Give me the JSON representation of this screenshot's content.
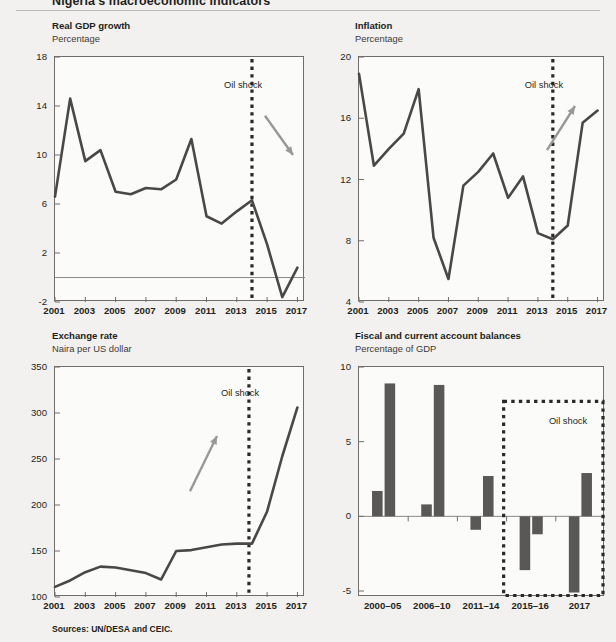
{
  "figure": {
    "title": "Nigeria's macroeconomic indicators",
    "sources": "Sources: UN/DESA and CEIC.",
    "oil_shock_label": "Oil shock",
    "line_color": "#4a4846",
    "bar_color": "#5a5856",
    "arrow_color": "#9a9896",
    "axis_color": "#6f6d6b"
  },
  "chart_data": [
    {
      "id": "real-gdp-growth",
      "type": "line",
      "title": "Real GDP growth",
      "subtitle": "Percentage",
      "xlabel": "",
      "ylabel": "Percentage",
      "ylim": [
        -2,
        18
      ],
      "yticks": [
        18,
        14,
        10,
        6,
        2,
        -2
      ],
      "xlim": [
        2001,
        2017.5
      ],
      "xticks": [
        2001,
        2003,
        2005,
        2007,
        2009,
        2011,
        2013,
        2015,
        2017
      ],
      "grid": false,
      "zero_line": 0,
      "x": [
        2001,
        2002,
        2003,
        2004,
        2005,
        2006,
        2007,
        2008,
        2009,
        2010,
        2011,
        2012,
        2013,
        2014,
        2015,
        2016,
        2017
      ],
      "values": [
        6.6,
        14.6,
        9.5,
        10.4,
        7.0,
        6.8,
        7.3,
        7.2,
        8.0,
        11.3,
        5.0,
        4.4,
        5.4,
        6.3,
        2.7,
        -1.6,
        0.8
      ],
      "annotations": [
        {
          "kind": "vline",
          "label": "Oil shock",
          "x": 2014
        },
        {
          "kind": "arrow",
          "direction": "down-right"
        }
      ]
    },
    {
      "id": "inflation",
      "type": "line",
      "title": "Inflation",
      "subtitle": "Percentage",
      "xlabel": "",
      "ylabel": "Percentage",
      "ylim": [
        4,
        20
      ],
      "yticks": [
        20,
        16,
        12,
        8,
        4
      ],
      "xlim": [
        2001,
        2017.5
      ],
      "xticks": [
        2001,
        2003,
        2005,
        2007,
        2009,
        2011,
        2013,
        2015,
        2017
      ],
      "grid": false,
      "x": [
        2001,
        2002,
        2003,
        2004,
        2005,
        2006,
        2007,
        2008,
        2009,
        2010,
        2011,
        2012,
        2013,
        2014,
        2015,
        2016,
        2017
      ],
      "values": [
        18.9,
        12.9,
        14.0,
        15.0,
        17.9,
        8.2,
        5.5,
        11.6,
        12.5,
        13.7,
        10.8,
        12.2,
        8.5,
        8.1,
        9.0,
        15.7,
        16.5
      ],
      "annotations": [
        {
          "kind": "vline",
          "label": "Oil shock",
          "x": 2014
        },
        {
          "kind": "arrow",
          "direction": "up-right"
        }
      ]
    },
    {
      "id": "exchange-rate",
      "type": "line",
      "title": "Exchange rate",
      "subtitle": "Naira per US dollar",
      "xlabel": "",
      "ylabel": "Naira per US dollar",
      "ylim": [
        100,
        350
      ],
      "yticks": [
        350,
        300,
        250,
        200,
        150,
        100
      ],
      "xlim": [
        2001,
        2017.5
      ],
      "xticks": [
        2001,
        2003,
        2005,
        2007,
        2009,
        2011,
        2013,
        2015,
        2017
      ],
      "grid": false,
      "x": [
        2001,
        2002,
        2003,
        2004,
        2005,
        2006,
        2007,
        2008,
        2009,
        2010,
        2011,
        2012,
        2013,
        2014,
        2015,
        2016,
        2017
      ],
      "values": [
        111,
        118,
        127,
        133,
        132,
        129,
        126,
        119,
        150,
        151,
        154,
        157,
        158,
        158,
        193,
        253,
        306
      ],
      "annotations": [
        {
          "kind": "vline",
          "label": "Oil shock",
          "x": 2013.8
        },
        {
          "kind": "arrow",
          "direction": "up-right"
        }
      ]
    },
    {
      "id": "fiscal-current-account",
      "type": "bar",
      "title": "Fiscal and current account balances",
      "subtitle": "Percentage of GDP",
      "xlabel": "",
      "ylabel": "Percentage of GDP",
      "ylim": [
        -5.4,
        10
      ],
      "yticks": [
        10,
        5,
        0,
        -5
      ],
      "grid": false,
      "zero_line": 0,
      "categories": [
        "2000–05",
        "2006–10",
        "2011–14",
        "2015–16",
        "2017"
      ],
      "series": [
        {
          "name": "Fiscal balance",
          "values": [
            1.7,
            0.8,
            -0.9,
            -3.6,
            -5.1
          ]
        },
        {
          "name": "Current account balance",
          "values": [
            8.9,
            8.8,
            2.7,
            -1.2,
            2.9
          ]
        }
      ],
      "annotations": [
        {
          "kind": "box",
          "label": "Oil shock",
          "from_category": "2015–16",
          "to_category": "2017",
          "y_top": 7.7,
          "y_bottom": -5.3
        }
      ]
    }
  ]
}
